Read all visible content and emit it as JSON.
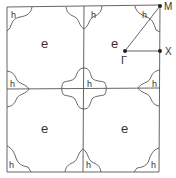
{
  "diagram": {
    "electron_label": "e",
    "hole_label": "h",
    "points": {
      "gamma": "Γ",
      "x": "X",
      "m": "M"
    },
    "colors": {
      "line": "#555555",
      "text": "#333333",
      "background": "#ffffff"
    }
  }
}
